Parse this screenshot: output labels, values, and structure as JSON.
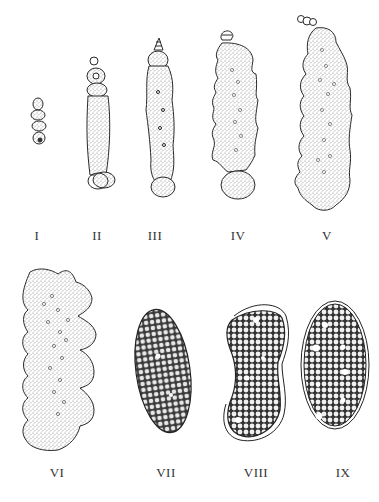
{
  "figure": {
    "panels": [
      {
        "id": "I",
        "label": "I",
        "shape": "small-segmented-chain"
      },
      {
        "id": "II",
        "label": "II",
        "shape": "elongated-chain-with-head"
      },
      {
        "id": "III",
        "label": "III",
        "shape": "elongated-chain-lobed"
      },
      {
        "id": "IV",
        "label": "IV",
        "shape": "lobed-colony"
      },
      {
        "id": "V",
        "label": "V",
        "shape": "large-lobed-colony"
      },
      {
        "id": "VI",
        "label": "VI",
        "shape": "broad-lobed-mass"
      },
      {
        "id": "VII",
        "label": "VII",
        "shape": "oval-cellular-mass"
      },
      {
        "id": "VIII",
        "label": "VIII",
        "shape": "bean-shaped-encapsulated-mass"
      },
      {
        "id": "IX",
        "label": "IX",
        "shape": "oval-encapsulated-mass"
      }
    ],
    "caption": "",
    "colors": {
      "ink": "#2a2a2a",
      "stipple": "#9a9a9a",
      "background": "#ffffff"
    }
  }
}
